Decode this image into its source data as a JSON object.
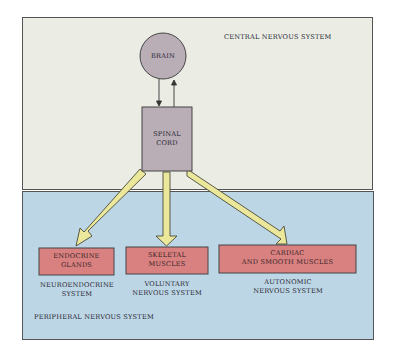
{
  "colors": {
    "cns_bg": "#ebede5",
    "pns_bg": "#bdd6e5",
    "node_gray": "#b8acb4",
    "target_box": "#d98080",
    "arrow_fill": "#ece89a",
    "outline": "#444444"
  },
  "cns": {
    "title": "CENTRAL NERVOUS SYSTEM",
    "brain_label": "BRAIN",
    "spinal_cord_line1": "SPINAL",
    "spinal_cord_line2": "CORD"
  },
  "pns": {
    "title": "PERIPHERAL NERVOUS SYSTEM",
    "targets": [
      {
        "box_line1": "ENDOCRINE",
        "box_line2": "GLANDS",
        "system_line1": "NEUROENDOCRINE",
        "system_line2": "SYSTEM"
      },
      {
        "box_line1": "SKELETAL",
        "box_line2": "MUSCLES",
        "system_line1": "VOLUNTARY",
        "system_line2": "NERVOUS SYSTEM"
      },
      {
        "box_line1": "CARDIAC",
        "box_line2": "AND SMOOTH MUSCLES",
        "system_line1": "AUTONOMIC",
        "system_line2": "NERVOUS SYSTEM"
      }
    ]
  }
}
